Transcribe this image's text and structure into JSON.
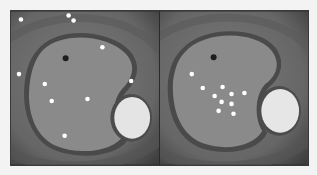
{
  "figure": {
    "panels": [
      {
        "id": "left",
        "reference_point": {
          "x": 55,
          "y": 47
        },
        "sample_points": [
          {
            "x": 10,
            "y": 8
          },
          {
            "x": 58,
            "y": 4
          },
          {
            "x": 63,
            "y": 9
          },
          {
            "x": 8,
            "y": 63
          },
          {
            "x": 34,
            "y": 73
          },
          {
            "x": 41,
            "y": 90
          },
          {
            "x": 54,
            "y": 125
          },
          {
            "x": 92,
            "y": 36
          },
          {
            "x": 77,
            "y": 88
          },
          {
            "x": 121,
            "y": 70
          }
        ]
      },
      {
        "id": "right",
        "reference_point": {
          "x": 54,
          "y": 46
        },
        "sample_points": [
          {
            "x": 32,
            "y": 63
          },
          {
            "x": 43,
            "y": 77
          },
          {
            "x": 63,
            "y": 76
          },
          {
            "x": 55,
            "y": 85
          },
          {
            "x": 72,
            "y": 83
          },
          {
            "x": 85,
            "y": 82
          },
          {
            "x": 62,
            "y": 91
          },
          {
            "x": 72,
            "y": 93
          },
          {
            "x": 59,
            "y": 100
          },
          {
            "x": 74,
            "y": 103
          }
        ]
      }
    ],
    "colors": {
      "page_background": "#f3f3f3",
      "outer_field": "#6e6e6e",
      "ring_band": "#4a4a4a",
      "inner_region": "#8a8a8a",
      "bright_ellipse": "#e6e6e6",
      "sample_point": "#ffffff",
      "reference_point": "#1e1e1e"
    }
  }
}
